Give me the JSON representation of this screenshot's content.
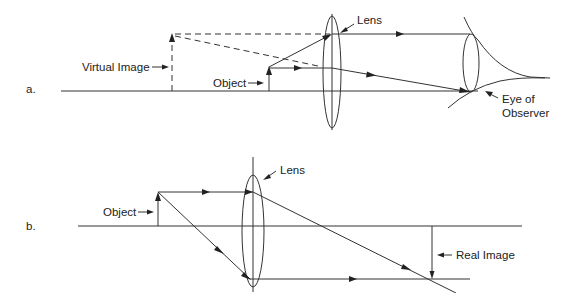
{
  "diagram": {
    "part_a": {
      "panel_label": "a.",
      "labels": {
        "virtual_image": "Virtual Image",
        "object": "Object",
        "lens": "Lens",
        "eye_line1": "Eye of",
        "eye_line2": "Observer"
      }
    },
    "part_b": {
      "panel_label": "b.",
      "labels": {
        "object": "Object",
        "lens": "Lens",
        "real_image": "Real Image"
      }
    },
    "colors": {
      "line": "#333333",
      "text": "#222222",
      "background": "#ffffff"
    }
  }
}
